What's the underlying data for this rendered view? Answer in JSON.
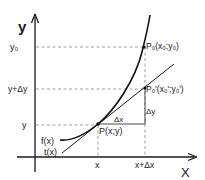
{
  "diagram": {
    "axes": {
      "x_label": "X",
      "y_label": "y"
    },
    "y_ticks": [
      {
        "label": "y₀",
        "y": 47
      },
      {
        "label": "y+Δy",
        "y": 89
      },
      {
        "label": "y",
        "y": 125
      }
    ],
    "x_ticks": [
      {
        "label": "x",
        "x": 98
      },
      {
        "label": "x+Δx",
        "x": 145
      }
    ],
    "points": {
      "P": "P(x;y)",
      "P0": "P₀(x₀;y₀)",
      "P0_prime": "P₀'(x₀';y₀')"
    },
    "increments": {
      "dx": "Δx",
      "dy": "Δy"
    },
    "functions": {
      "f": "f(x)",
      "t": "t(x)"
    },
    "colors": {
      "ink": "#1a1a1a",
      "dashed": "#888888",
      "background": "#ffffff"
    }
  }
}
